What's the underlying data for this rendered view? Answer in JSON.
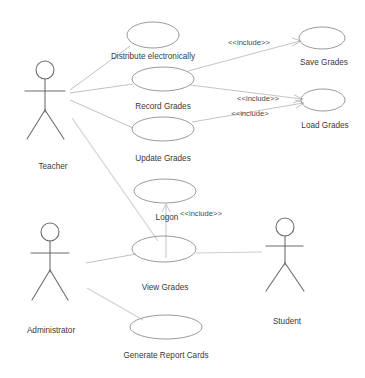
{
  "diagram": {
    "kind": "uml-use-case-diagram",
    "background_color": "#ffffff",
    "stroke_color": "#8f8f8f",
    "text_color": "#3a3a3a"
  },
  "actors": [
    {
      "id": "teacher",
      "label": "Teacher",
      "cx": 45,
      "label_y": 163
    },
    {
      "id": "administrator",
      "label": "Administrator",
      "cx": 50,
      "label_y": 327
    },
    {
      "id": "student",
      "label": "Student",
      "cx": 285,
      "label_y": 318
    }
  ],
  "use_cases": [
    {
      "id": "distribute-electronically",
      "label": "Distribute electronically",
      "cx": 153,
      "cy": 35,
      "label_y": 53
    },
    {
      "id": "record-grades",
      "label": "Record Grades",
      "cx": 163,
      "cy": 79,
      "label_y": 103
    },
    {
      "id": "update-grades",
      "label": "Update Grades",
      "cx": 163,
      "cy": 129,
      "label_y": 155
    },
    {
      "id": "save-grades",
      "label": "Save Grades",
      "cx": 322,
      "cy": 38,
      "label_y": 59
    },
    {
      "id": "load-grades",
      "label": "Load Grades",
      "cx": 323,
      "cy": 100,
      "label_y": 122
    },
    {
      "id": "logon",
      "label": "Logon",
      "cx": 165,
      "cy": 191,
      "label_y": 214
    },
    {
      "id": "view-grades",
      "label": "View Grades",
      "cx": 164,
      "cy": 249,
      "label_y": 284
    },
    {
      "id": "generate-report-cards",
      "label": "Generate Report Cards",
      "cx": 166,
      "cy": 327,
      "label_y": 352
    }
  ],
  "relationships": [
    {
      "id": "record-to-save",
      "stereotype": "<<include>>",
      "label_x": 249,
      "label_y": 39,
      "from": "record-grades",
      "to": "save-grades"
    },
    {
      "id": "record-to-load",
      "stereotype": "<<include>>",
      "label_x": 258,
      "label_y": 95,
      "from": "record-grades",
      "to": "load-grades"
    },
    {
      "id": "update-to-load",
      "stereotype": "<<include>",
      "label_x": 250,
      "label_y": 110,
      "from": "update-grades",
      "to": "load-grades"
    },
    {
      "id": "viewgrades-to-logon",
      "stereotype": "<<include>>",
      "label_x": 201,
      "label_y": 210,
      "from": "view-grades",
      "to": "logon"
    }
  ],
  "associations": [
    {
      "id": "teacher-distribute",
      "from": "teacher",
      "to": "distribute-electronically"
    },
    {
      "id": "teacher-record",
      "from": "teacher",
      "to": "record-grades"
    },
    {
      "id": "teacher-update",
      "from": "teacher",
      "to": "update-grades"
    },
    {
      "id": "teacher-viewgrades",
      "from": "teacher",
      "to": "view-grades"
    },
    {
      "id": "administrator-viewgrades",
      "from": "administrator",
      "to": "view-grades"
    },
    {
      "id": "administrator-generate",
      "from": "administrator",
      "to": "generate-report-cards"
    },
    {
      "id": "student-viewgrades",
      "from": "student",
      "to": "view-grades"
    }
  ]
}
